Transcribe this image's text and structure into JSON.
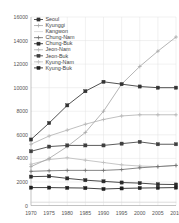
{
  "chart_data": {
    "type": "line",
    "title": "",
    "xlabel": "",
    "ylabel": "",
    "x": [
      1970,
      1975,
      1980,
      1985,
      1990,
      1995,
      2000,
      2005,
      2010
    ],
    "xticklabels": [
      "1970",
      "1975",
      "1980",
      "1985",
      "1990",
      "1995",
      "2000",
      "2005",
      "2010"
    ],
    "yticklabels": [
      "0",
      "2000",
      "4000",
      "6000",
      "8000",
      "10000",
      "12000",
      "14000",
      "16000"
    ],
    "yticks": [
      0,
      2000,
      4000,
      6000,
      8000,
      10000,
      12000,
      14000,
      16000
    ],
    "xlim": [
      1970,
      2010
    ],
    "ylim": [
      0,
      16000
    ],
    "grid": true,
    "legend_position": "top-left",
    "series": [
      {
        "name": "Seoul",
        "color": "#333333",
        "marker": "square",
        "values": [
          5600,
          7000,
          8500,
          9700,
          10500,
          10300,
          10100,
          10000,
          10000
        ]
      },
      {
        "name": "Kyunggi",
        "color": "#a8a8a8",
        "marker": "plus",
        "values": [
          3300,
          4000,
          5000,
          6200,
          8000,
          10300,
          11800,
          13100,
          14300
        ]
      },
      {
        "name": "Kangwon",
        "color": "#cfcfcf",
        "marker": "none",
        "values": [
          280,
          280,
          280,
          280,
          280,
          280,
          280,
          280,
          280
        ]
      },
      {
        "name": "Chung-Nam",
        "color": "#707070",
        "marker": "plus",
        "values": [
          2900,
          2950,
          2980,
          2980,
          2980,
          3050,
          3200,
          3300,
          3400
        ]
      },
      {
        "name": "Chung-Buk",
        "color": "#2b2b2b",
        "marker": "square",
        "values": [
          2450,
          2480,
          2300,
          2150,
          2050,
          1950,
          1900,
          1800,
          1780
        ]
      },
      {
        "name": "Jeon-Nam",
        "color": "#b5b5b5",
        "marker": "plus",
        "values": [
          5200,
          5900,
          6400,
          6900,
          7300,
          7600,
          7700,
          7700,
          7700
        ]
      },
      {
        "name": "Jeon-Buk",
        "color": "#3f3f3f",
        "marker": "square",
        "values": [
          4600,
          5000,
          5100,
          5100,
          5100,
          5250,
          5400,
          5200,
          5200
        ]
      },
      {
        "name": "Kyung-Nam",
        "color": "#bdbdbd",
        "marker": "plus",
        "values": [
          3500,
          3900,
          4050,
          3850,
          3650,
          3450,
          3350,
          3300,
          3400
        ]
      },
      {
        "name": "Kyung-Buk",
        "color": "#1f1f1f",
        "marker": "square",
        "values": [
          1520,
          1520,
          1500,
          1480,
          1400,
          1450,
          1480,
          1500,
          1520
        ]
      }
    ]
  }
}
